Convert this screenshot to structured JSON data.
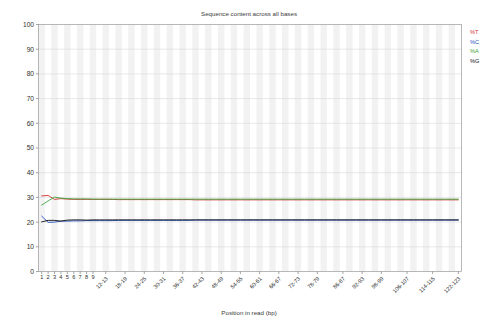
{
  "chart_data": {
    "type": "line",
    "title": "Sequence content across all bases",
    "xlabel": "Position in read (bp)",
    "ylabel": "",
    "ylim": [
      0,
      100
    ],
    "yticks": [
      0,
      10,
      20,
      30,
      40,
      50,
      60,
      70,
      80,
      90,
      100
    ],
    "grid": true,
    "legend_position": "top-right",
    "legend": [
      "%T",
      "%C",
      "%A",
      "%G"
    ],
    "categories": [
      "1",
      "2",
      "3",
      "4",
      "5",
      "6",
      "7",
      "8",
      "9",
      "10-11",
      "12-13",
      "14-15",
      "16-17",
      "18-19",
      "20-21",
      "22-23",
      "24-25",
      "26-27",
      "28-29",
      "30-31",
      "32-33",
      "34-35",
      "36-37",
      "38-39",
      "40-41",
      "42-43",
      "44-45",
      "46-47",
      "48-49",
      "50-51",
      "52-53",
      "54-55",
      "56-57",
      "58-59",
      "60-61",
      "62-63",
      "64-65",
      "66-67",
      "68-69",
      "70-71",
      "72-73",
      "74-75",
      "76-77",
      "78-79",
      "80-81",
      "82-83",
      "84-85",
      "86-87",
      "88-89",
      "90-91",
      "92-93",
      "94-95",
      "96-97",
      "98-99",
      "100-101",
      "102-103",
      "104-105",
      "106-107",
      "108-109",
      "110-111",
      "112-113",
      "114-115",
      "116-117",
      "118-119",
      "120-121",
      "122-123"
    ],
    "xtick_labels": [
      "1",
      "2",
      "3",
      "4",
      "5",
      "6",
      "7",
      "8",
      "9",
      "12-13",
      "18-19",
      "24-25",
      "30-31",
      "36-37",
      "42-43",
      "48-49",
      "54-55",
      "60-61",
      "66-67",
      "72-73",
      "78-79",
      "86-87",
      "92-93",
      "98-99",
      "106-107",
      "114-115",
      "122-123"
    ],
    "xtick_indices": [
      0,
      1,
      2,
      3,
      4,
      5,
      6,
      7,
      8,
      10,
      13,
      16,
      19,
      22,
      25,
      28,
      31,
      34,
      37,
      40,
      43,
      47,
      50,
      53,
      57,
      61,
      65
    ],
    "series": [
      {
        "name": "%T",
        "color": "#d03030",
        "values": [
          30.6,
          30.8,
          29.2,
          29.5,
          29.3,
          29.2,
          29.2,
          29.2,
          29.2,
          29.2,
          29.2,
          29.2,
          29.1,
          29.1,
          29.1,
          29.1,
          29.1,
          29.1,
          29.1,
          29.1,
          29.1,
          29.1,
          29.1,
          29.1,
          29.0,
          29.0,
          29.0,
          29.0,
          29.0,
          29.0,
          29.0,
          29.0,
          29.0,
          29.0,
          29.0,
          29.0,
          29.0,
          29.0,
          29.0,
          29.0,
          29.0,
          29.0,
          29.0,
          29.0,
          29.0,
          29.0,
          29.0,
          29.0,
          29.0,
          29.0,
          29.0,
          29.0,
          29.0,
          29.0,
          29.0,
          29.0,
          29.0,
          29.0,
          29.0,
          29.0,
          29.0,
          29.0,
          29.0,
          29.0,
          29.0,
          29.0
        ]
      },
      {
        "name": "%C",
        "color": "#2050c0",
        "values": [
          22.4,
          19.9,
          20.0,
          20.4,
          20.4,
          20.5,
          20.5,
          20.6,
          20.6,
          20.6,
          20.6,
          20.6,
          20.7,
          20.7,
          20.7,
          20.7,
          20.7,
          20.7,
          20.7,
          20.7,
          20.7,
          20.7,
          20.7,
          20.7,
          20.8,
          20.8,
          20.8,
          20.8,
          20.8,
          20.8,
          20.8,
          20.8,
          20.8,
          20.8,
          20.8,
          20.8,
          20.8,
          20.8,
          20.8,
          20.8,
          20.8,
          20.8,
          20.8,
          20.8,
          20.8,
          20.8,
          20.8,
          20.8,
          20.8,
          20.8,
          20.8,
          20.8,
          20.8,
          20.8,
          20.8,
          20.8,
          20.8,
          20.8,
          20.8,
          20.8,
          20.8,
          20.8,
          20.8,
          20.8,
          20.8,
          20.8
        ]
      },
      {
        "name": "%A",
        "color": "#3aa53a",
        "values": [
          26.9,
          28.6,
          30.1,
          29.7,
          29.5,
          29.4,
          29.4,
          29.4,
          29.3,
          29.3,
          29.3,
          29.3,
          29.3,
          29.3,
          29.3,
          29.3,
          29.3,
          29.3,
          29.3,
          29.3,
          29.3,
          29.3,
          29.3,
          29.3,
          29.3,
          29.3,
          29.3,
          29.3,
          29.3,
          29.3,
          29.3,
          29.3,
          29.3,
          29.3,
          29.3,
          29.3,
          29.3,
          29.3,
          29.3,
          29.3,
          29.3,
          29.3,
          29.3,
          29.3,
          29.3,
          29.3,
          29.3,
          29.3,
          29.3,
          29.3,
          29.3,
          29.3,
          29.3,
          29.3,
          29.3,
          29.3,
          29.3,
          29.3,
          29.3,
          29.3,
          29.3,
          29.3,
          29.3,
          29.3,
          29.3,
          29.3
        ]
      },
      {
        "name": "%G",
        "color": "#101010",
        "values": [
          20.1,
          20.7,
          20.7,
          20.4,
          20.8,
          20.9,
          20.9,
          20.8,
          20.9,
          20.9,
          20.9,
          20.9,
          20.9,
          20.9,
          20.9,
          20.9,
          20.9,
          20.9,
          20.9,
          20.9,
          20.9,
          20.9,
          20.9,
          20.9,
          20.9,
          20.9,
          20.9,
          20.9,
          20.9,
          20.9,
          20.9,
          20.9,
          20.9,
          20.9,
          20.9,
          20.9,
          20.9,
          20.9,
          20.9,
          20.9,
          20.9,
          20.9,
          20.9,
          20.9,
          20.9,
          20.9,
          20.9,
          20.9,
          20.9,
          20.9,
          20.9,
          20.9,
          20.9,
          20.9,
          20.9,
          20.9,
          20.9,
          20.9,
          20.9,
          20.9,
          20.9,
          20.9,
          20.9,
          20.9,
          20.9,
          20.9
        ]
      }
    ]
  }
}
